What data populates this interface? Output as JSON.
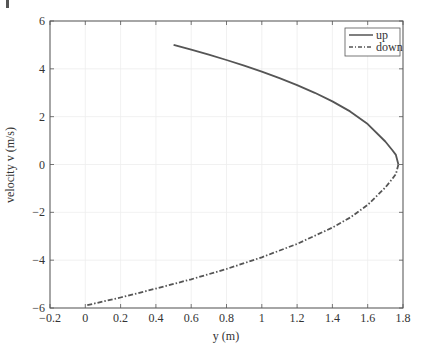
{
  "chart_data": {
    "type": "line",
    "title": "",
    "xlabel": "y (m)",
    "ylabel": "velocity v (m/s)",
    "xlim": [
      -0.2,
      1.8
    ],
    "ylim": [
      -6,
      6
    ],
    "xticks": [
      -0.2,
      0,
      0.2,
      0.4,
      0.6,
      0.8,
      1,
      1.2,
      1.4,
      1.6,
      1.8
    ],
    "xtick_labels": [
      "−0.2",
      "0",
      "0.2",
      "0.4",
      "0.6",
      "0.8",
      "1",
      "1.2",
      "1.4",
      "1.6",
      "1.8"
    ],
    "yticks": [
      -6,
      -4,
      -2,
      0,
      2,
      4,
      6
    ],
    "ytick_labels": [
      "−6",
      "−4",
      "−2",
      "0",
      "2",
      "4",
      "6"
    ],
    "grid": true,
    "legend_position": "upper right",
    "series": [
      {
        "name": "up",
        "style": "solid",
        "color": "#555555",
        "x": [
          0.5,
          0.6,
          0.7,
          0.8,
          0.9,
          1.0,
          1.1,
          1.2,
          1.3,
          1.4,
          1.5,
          1.6,
          1.7,
          1.74,
          1.76,
          1.774
        ],
        "y": [
          5.0,
          4.8,
          4.59,
          4.37,
          4.13,
          3.88,
          3.61,
          3.32,
          3.0,
          2.64,
          2.22,
          1.69,
          0.96,
          0.6,
          0.4,
          0.0
        ]
      },
      {
        "name": "down",
        "style": "dash-dot",
        "color": "#555555",
        "x": [
          1.774,
          1.76,
          1.74,
          1.7,
          1.6,
          1.5,
          1.4,
          1.2,
          1.0,
          0.8,
          0.6,
          0.4,
          0.2,
          0.0
        ],
        "y": [
          0.0,
          -0.4,
          -0.6,
          -0.96,
          -1.69,
          -2.22,
          -2.64,
          -3.32,
          -3.88,
          -4.37,
          -4.8,
          -5.19,
          -5.56,
          -5.9
        ]
      }
    ]
  },
  "legend": {
    "up": "up",
    "down": "down"
  }
}
